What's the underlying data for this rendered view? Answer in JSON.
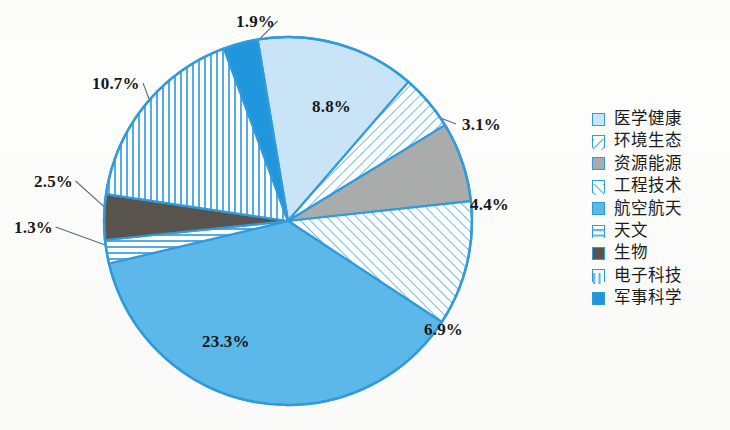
{
  "chart_data": {
    "type": "pie",
    "title": "",
    "subtitle": "",
    "xlabel": "",
    "ylabel": "",
    "legend_position": "right",
    "grid": false,
    "units": "percent",
    "start_angle_deg": -9.5,
    "direction": "clockwise",
    "categories": [
      "医学健康",
      "环境生态",
      "资源能源",
      "工程技术",
      "航空航天",
      "天文",
      "生物",
      "电子科技",
      "军事科学"
    ],
    "values": [
      8.8,
      3.1,
      4.4,
      6.9,
      23.3,
      1.3,
      2.5,
      10.7,
      1.9
    ],
    "value_labels": [
      "8.8%",
      "3.1%",
      "4.4%",
      "6.9%",
      "23.3%",
      "1.3%",
      "2.5%",
      "10.7%",
      "1.9%"
    ],
    "slices": [
      {
        "label": "医学健康",
        "value": 8.8,
        "value_label": "8.8%",
        "fill": "#c9e4f6",
        "pattern": "solid",
        "label_x": 312,
        "label_y": 97,
        "label_placement": "inside"
      },
      {
        "label": "环境生态",
        "value": 3.1,
        "value_label": "3.1%",
        "fill": "#ffffff",
        "pattern": "diagonal-forward",
        "label_x": 462,
        "label_y": 115,
        "label_placement": "outside-leader"
      },
      {
        "label": "资源能源",
        "value": 4.4,
        "value_label": "4.4%",
        "fill": "#aaabab",
        "pattern": "solid",
        "label_x": 470,
        "label_y": 195,
        "label_placement": "outside-leader"
      },
      {
        "label": "工程技术",
        "value": 6.9,
        "value_label": "6.9%",
        "fill": "#ffffff",
        "pattern": "diagonal-backward",
        "label_x": 424,
        "label_y": 320,
        "label_placement": "outside-leader"
      },
      {
        "label": "航空航天",
        "value": 23.3,
        "value_label": "23.3%",
        "fill": "#5cb8e8",
        "pattern": "solid",
        "label_x": 202,
        "label_y": 332,
        "label_placement": "inside"
      },
      {
        "label": "天文",
        "value": 1.3,
        "value_label": "1.3%",
        "fill": "#ffffff",
        "pattern": "horizontal",
        "label_x": 14,
        "label_y": 218,
        "label_placement": "outside-leader"
      },
      {
        "label": "生物",
        "value": 2.5,
        "value_label": "2.5%",
        "fill": "#59534d",
        "pattern": "solid",
        "label_x": 34,
        "label_y": 172,
        "label_placement": "outside-leader"
      },
      {
        "label": "电子科技",
        "value": 10.7,
        "value_label": "10.7%",
        "fill": "#ffffff",
        "pattern": "vertical",
        "label_x": 92,
        "label_y": 74,
        "label_placement": "outside-leader"
      },
      {
        "label": "军事科学",
        "value": 1.9,
        "value_label": "1.9%",
        "fill": "#2196dd",
        "pattern": "solid",
        "label_x": 236,
        "label_y": 12,
        "label_placement": "outside-leader"
      }
    ],
    "colors": {
      "accent": "#2f9bdd",
      "outline": "#2f9bdd",
      "pale_blue": "#c9e4f6",
      "medium_blue": "#5cb8e8",
      "strong_blue": "#2196dd",
      "gray": "#aaabab",
      "dark_gray": "#59534d",
      "label_text": "#17171a"
    }
  },
  "legend": {
    "items": [
      {
        "label": "医学健康",
        "pattern": "solid",
        "fill": "#c9e4f6"
      },
      {
        "label": "环境生态",
        "pattern": "diagonal-forward",
        "fill": "#ffffff"
      },
      {
        "label": "资源能源",
        "pattern": "solid",
        "fill": "#aaabab"
      },
      {
        "label": "工程技术",
        "pattern": "diagonal-backward",
        "fill": "#ffffff"
      },
      {
        "label": "航空航天",
        "pattern": "solid",
        "fill": "#5cb8e8"
      },
      {
        "label": "天文",
        "pattern": "horizontal",
        "fill": "#ffffff"
      },
      {
        "label": "生物",
        "pattern": "solid",
        "fill": "#59534d"
      },
      {
        "label": "电子科技",
        "pattern": "vertical",
        "fill": "#ffffff"
      },
      {
        "label": "军事科学",
        "pattern": "solid",
        "fill": "#2196dd"
      }
    ]
  }
}
